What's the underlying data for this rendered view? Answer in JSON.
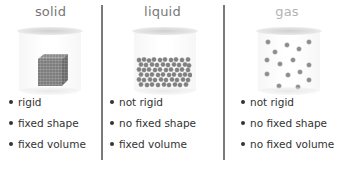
{
  "states": [
    {
      "id": "solid",
      "title": "solid",
      "illustration": "packed-cube-of-particles",
      "properties": [
        "rigid",
        "fixed shape",
        "fixed volume"
      ]
    },
    {
      "id": "liquid",
      "title": "liquid",
      "illustration": "loosely-packed-particles-at-bottom",
      "properties": [
        "not rigid",
        "no fixed shape",
        "fixed volume"
      ]
    },
    {
      "id": "gas",
      "title": "gas",
      "illustration": "scattered-particles-filling-container",
      "properties": [
        "not rigid",
        "no fixed shape",
        "no fixed volume"
      ]
    }
  ],
  "colors": {
    "title": "#777777",
    "title_gas": "#b3b3b3",
    "text": "#333333",
    "divider": "#7a7a7a",
    "particle": "#8a8a8a"
  }
}
